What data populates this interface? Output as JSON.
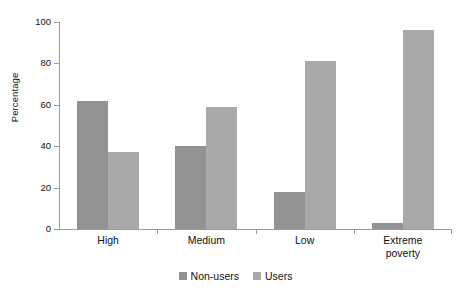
{
  "chart_data": {
    "type": "bar",
    "title": "",
    "subtitle": "",
    "xlabel": "",
    "ylabel": "Percentage",
    "ylim": [
      0,
      100
    ],
    "yticks": [
      0,
      20,
      40,
      60,
      80,
      100
    ],
    "grid": false,
    "legend_position": "bottom-center",
    "categories": [
      "High",
      "Medium",
      "Low",
      "Extreme poverty"
    ],
    "category_lines": [
      [
        "High"
      ],
      [
        "Medium"
      ],
      [
        "Low"
      ],
      [
        "Extreme",
        "poverty"
      ]
    ],
    "series": [
      {
        "name": "Non-users",
        "color": "#929292",
        "values": [
          62,
          40,
          18,
          3
        ]
      },
      {
        "name": "Users",
        "color": "#a9a9a9",
        "values": [
          37,
          59,
          81,
          96
        ]
      }
    ]
  },
  "axes": {
    "y_title": "Percentage",
    "y_tick_labels": [
      "0",
      "20",
      "40",
      "60",
      "80",
      "100"
    ]
  },
  "legend": {
    "items": [
      {
        "label": "Non-users",
        "color": "#929292"
      },
      {
        "label": "Users",
        "color": "#a9a9a9"
      }
    ]
  },
  "colors": {
    "axis": "#9b9b9b",
    "text": "#111111",
    "background": "#ffffff",
    "series_non_users": "#929292",
    "series_users": "#a9a9a9"
  }
}
